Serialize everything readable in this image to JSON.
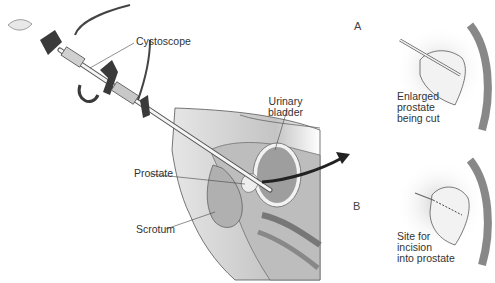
{
  "diagram": {
    "labels": {
      "cystoscope": "Cystoscope",
      "urinary_bladder": "Urinary\nbladder",
      "prostate": "Prostate",
      "scrotum": "Scrotum"
    },
    "panels": [
      {
        "id": "A",
        "letter": "A",
        "caption": "Enlarged\nprostate\nbeing cut"
      },
      {
        "id": "B",
        "letter": "B",
        "caption": "Site for\nincision\ninto prostate"
      }
    ],
    "colors": {
      "tissue_light": "#d9d9d9",
      "tissue_mid": "#b5b5b5",
      "tissue_dark": "#8a8a8a",
      "instrument_dark": "#3a3a3a",
      "line": "#444444",
      "text": "#333333"
    }
  }
}
